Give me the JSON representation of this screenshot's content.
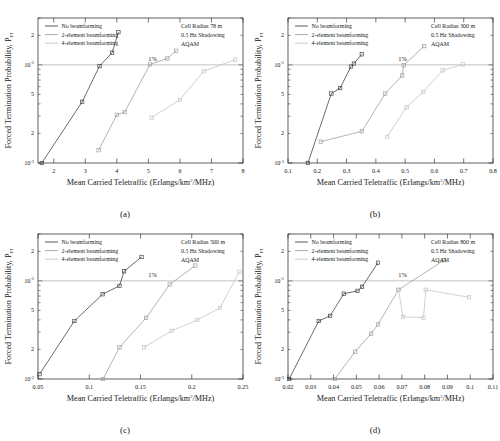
{
  "figure": {
    "panels": [
      "a",
      "b",
      "c",
      "d"
    ],
    "captions": {
      "a": "(a)",
      "b": "(b)",
      "c": "(c)",
      "d": "(d)"
    },
    "legend_labels": [
      "No beamforming",
      "2-element beamforming",
      "4-element beamforming"
    ],
    "series_colors": [
      "#3b3b3b",
      "#9b9b9b",
      "#c2c2c2"
    ],
    "reference_label": "1%",
    "shared_annotation": [
      "0.5 Hz Shadowing",
      "AQAM"
    ]
  },
  "chart_data": [
    {
      "panel": "a",
      "type": "line",
      "title": "",
      "xlabel": "Mean Carried Teletraffic (Erlangs/km2/MHz)",
      "ylabel": "Forced Termination Probability, PFT",
      "xscale": "linear",
      "yscale": "log",
      "xlim": [
        1.5,
        8
      ],
      "ylim": [
        0.001,
        0.03
      ],
      "xticks": [
        2,
        3,
        4,
        5,
        6,
        7,
        8
      ],
      "xticklabels": [
        "2",
        "3",
        "4",
        "5",
        "6",
        "7",
        "8"
      ],
      "yticklabels": [
        "10-3",
        "10-2"
      ],
      "grid": false,
      "legend_position": "top-left",
      "annotation": [
        "Cell Radius 78 m",
        "0.5 Hz Shadowing",
        "AQAM"
      ],
      "reference_line": {
        "y": 0.01,
        "label": "1%"
      },
      "series": [
        {
          "name": "No beamforming",
          "x": [
            1.62,
            2.9,
            3.45,
            3.85,
            4.05
          ],
          "y": [
            0.001,
            0.0042,
            0.0097,
            0.0133,
            0.0215
          ]
        },
        {
          "name": "2-element beamforming",
          "x": [
            3.42,
            4.0,
            4.25,
            5.05,
            5.6,
            5.88
          ],
          "y": [
            0.00135,
            0.0031,
            0.0033,
            0.0101,
            0.0116,
            0.0139
          ]
        },
        {
          "name": "4-element beamforming",
          "x": [
            5.1,
            6.0,
            6.75,
            7.75
          ],
          "y": [
            0.0029,
            0.0044,
            0.0086,
            0.0113
          ]
        }
      ]
    },
    {
      "panel": "b",
      "type": "line",
      "title": "",
      "xlabel": "Mean Carried Teletraffic (Erlangs/km2/MHz)",
      "ylabel": "Forced Termination Probability, PFT",
      "xscale": "linear",
      "yscale": "log",
      "xlim": [
        0.1,
        0.8
      ],
      "ylim": [
        0.001,
        0.03
      ],
      "xticks": [
        0.1,
        0.2,
        0.3,
        0.4,
        0.5,
        0.6,
        0.7,
        0.8
      ],
      "xticklabels": [
        "0.1",
        "0.2",
        "0.3",
        "0.4",
        "0.5",
        "0.6",
        "0.7",
        "0.8"
      ],
      "yticklabels": [
        "10-3",
        "10-2"
      ],
      "grid": false,
      "legend_position": "top-left",
      "annotation": [
        "Cell Radius 300 m",
        "0.5 Hz Shadowing",
        "AQAM"
      ],
      "reference_line": {
        "y": 0.01,
        "label": "1%"
      },
      "series": [
        {
          "name": "No beamforming",
          "x": [
            0.168,
            0.248,
            0.278,
            0.315,
            0.325,
            0.352
          ],
          "y": [
            0.001,
            0.0051,
            0.0058,
            0.0096,
            0.0103,
            0.0128
          ]
        },
        {
          "name": "2-element beamforming",
          "x": [
            0.212,
            0.352,
            0.432,
            0.49,
            0.495,
            0.565
          ],
          "y": [
            0.00165,
            0.0021,
            0.0051,
            0.0078,
            0.0099,
            0.0155
          ]
        },
        {
          "name": "4-element beamforming",
          "x": [
            0.438,
            0.505,
            0.562,
            0.628,
            0.698
          ],
          "y": [
            0.00185,
            0.0037,
            0.0053,
            0.0088,
            0.0101
          ]
        }
      ]
    },
    {
      "panel": "c",
      "type": "line",
      "title": "",
      "xlabel": "Mean Carried Teletraffic (Erlangs/km2/MHz)",
      "ylabel": "Forced Termination Probability, PFT",
      "xscale": "linear",
      "yscale": "log",
      "xlim": [
        0.05,
        0.25
      ],
      "ylim": [
        0.001,
        0.03
      ],
      "xticks": [
        0.05,
        0.1,
        0.15,
        0.2,
        0.25
      ],
      "xticklabels": [
        "0.05",
        "0.1",
        "0.15",
        "0.2",
        "0.25"
      ],
      "yticklabels": [
        "10-3",
        "10-2"
      ],
      "grid": false,
      "legend_position": "top-left",
      "annotation": [
        "Cell Radius 500 m",
        "0.5 Hz Shadowing",
        "AQAM"
      ],
      "reference_line": {
        "y": 0.01,
        "label": "1%"
      },
      "series": [
        {
          "name": "No beamforming",
          "x": [
            0.0515,
            0.0855,
            0.113,
            0.1295,
            0.134,
            0.151
          ],
          "y": [
            0.00112,
            0.0039,
            0.0073,
            0.0089,
            0.0125,
            0.0175
          ]
        },
        {
          "name": "2-element beamforming",
          "x": [
            0.1135,
            0.1295,
            0.1555,
            0.1785,
            0.2035
          ],
          "y": [
            0.001,
            0.0021,
            0.0042,
            0.0092,
            0.0143
          ]
        },
        {
          "name": "4-element beamforming",
          "x": [
            0.1535,
            0.1805,
            0.2055,
            0.2275,
            0.2465
          ],
          "y": [
            0.0021,
            0.0031,
            0.004,
            0.0053,
            0.0124
          ]
        }
      ]
    },
    {
      "panel": "d",
      "type": "line",
      "title": "",
      "xlabel": "Mean Carried Teletraffic (Erlangs/km2/MHz)",
      "ylabel": "Forced Termination Probability, PFT",
      "xscale": "linear",
      "yscale": "log",
      "xlim": [
        0.02,
        0.11
      ],
      "ylim": [
        0.001,
        0.03
      ],
      "xticks": [
        0.02,
        0.03,
        0.04,
        0.05,
        0.06,
        0.07,
        0.08,
        0.09,
        0.1,
        0.11
      ],
      "xticklabels": [
        "0.02",
        "0.03",
        "0.04",
        "0.05",
        "0.06",
        "0.07",
        "0.08",
        "0.09",
        "0.1",
        "0.11"
      ],
      "yticklabels": [
        "10-3",
        "10-2"
      ],
      "grid": false,
      "legend_position": "top-left",
      "annotation": [
        "Cell Radius 800 m",
        "0.5 Hz Shadowing",
        "AQAM"
      ],
      "reference_line": {
        "y": 0.01,
        "label": "1%"
      },
      "series": [
        {
          "name": "No beamforming",
          "x": [
            0.0205,
            0.0335,
            0.0385,
            0.0445,
            0.0505,
            0.0525,
            0.0595
          ],
          "y": [
            0.001,
            0.0039,
            0.0044,
            0.0074,
            0.0079,
            0.0087,
            0.0153
          ]
        },
        {
          "name": "2-element beamforming",
          "x": [
            0.0405,
            0.0495,
            0.0565,
            0.0595,
            0.0685,
            0.0885
          ],
          "y": [
            0.001,
            0.0019,
            0.0029,
            0.0036,
            0.0081,
            0.0162
          ]
        },
        {
          "name": "4-element beamforming",
          "x": [
            0.0685,
            0.0705,
            0.0795,
            0.0805,
            0.0995
          ],
          "y": [
            0.0081,
            0.0043,
            0.0042,
            0.0081,
            0.0068
          ]
        }
      ]
    }
  ]
}
